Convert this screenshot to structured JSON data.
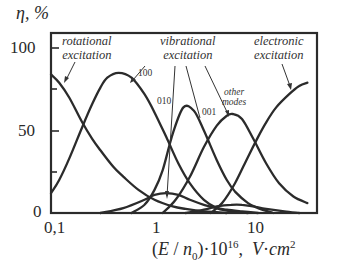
{
  "chart_data": {
    "type": "line",
    "title": "",
    "xlabel": "(E/n0)·10^16, V·cm^2",
    "ylabel": "η, %",
    "xscale": "log",
    "xlim": [
      0.1,
      38
    ],
    "ylim": [
      0,
      100
    ],
    "x_ticks": [
      "0,1",
      "1",
      "10"
    ],
    "y_ticks": [
      "0",
      "50",
      "100"
    ],
    "y_minor_ticks": [
      25,
      75
    ],
    "grid": false,
    "legend": "none (inline annotations)",
    "series": [
      {
        "name": "rotational excitation",
        "x": [
          0.1,
          0.12,
          0.15,
          0.2,
          0.25,
          0.3,
          0.4,
          0.5,
          0.7,
          1.0,
          1.5,
          2.0,
          3.0,
          4.0,
          5.0
        ],
        "values": [
          84,
          79,
          70,
          55,
          45,
          38,
          28,
          22,
          14,
          8,
          4,
          2.5,
          1,
          0.5,
          0
        ]
      },
      {
        "name": "vibrational 100",
        "x": [
          0.1,
          0.12,
          0.15,
          0.2,
          0.25,
          0.3,
          0.35,
          0.45,
          0.6,
          0.8,
          1.0,
          1.3,
          1.7,
          2.2,
          3.0,
          4.0,
          5.0,
          6.0,
          8.0
        ],
        "values": [
          12,
          20,
          33,
          52,
          66,
          76,
          82,
          85,
          82,
          72,
          61,
          46,
          30,
          18,
          8,
          3,
          1.5,
          0.8,
          0
        ]
      },
      {
        "name": "vibrational 010",
        "x": [
          0.6,
          0.8,
          1.0,
          1.2,
          1.5,
          1.9,
          2.4,
          3.0,
          4.0,
          5.0,
          6.0,
          8.0,
          10.0,
          14.0
        ],
        "values": [
          0,
          5,
          14,
          26,
          48,
          64,
          62,
          50,
          32,
          20,
          13,
          6,
          3,
          0
        ]
      },
      {
        "name": "vibrational 001",
        "x": [
          0.3,
          0.5,
          0.8,
          1.0,
          1.3,
          1.7,
          2.2,
          3.0,
          4.0,
          5.0,
          7.0,
          10.0
        ],
        "values": [
          0,
          3,
          8,
          11,
          12,
          11,
          8,
          5,
          3,
          2,
          1,
          0
        ]
      },
      {
        "name": "other modes",
        "x": [
          1.2,
          1.6,
          2.2,
          3.0,
          4.0,
          5.0,
          5.7,
          7.0,
          9.0,
          12.0,
          16.0,
          22.0,
          30.0
        ],
        "values": [
          0,
          8,
          22,
          40,
          53,
          59,
          60,
          57,
          45,
          30,
          18,
          10,
          6
        ]
      },
      {
        "name": "other modes (small)",
        "x": [
          2.0,
          3.0,
          4.0,
          5.5,
          7.0,
          9.0,
          12.0,
          18.0,
          25.0
        ],
        "values": [
          0,
          2,
          4,
          5,
          5,
          4,
          2.5,
          1,
          0
        ]
      },
      {
        "name": "electronic excitation",
        "x": [
          3.5,
          4.5,
          6.0,
          8.0,
          10.0,
          12.0,
          15.0,
          20.0,
          25.0,
          30.0
        ],
        "values": [
          0,
          6,
          18,
          34,
          46,
          55,
          64,
          72,
          77,
          79
        ]
      }
    ],
    "annotations": [
      {
        "text": "rotational excitation",
        "points_to": "rotational excitation curve"
      },
      {
        "text": "vibrational excitation",
        "points_to": [
          "100",
          "010",
          "001",
          "other modes"
        ]
      },
      {
        "text": "100",
        "points_to": "vibrational 100"
      },
      {
        "text": "010",
        "points_to": "vibrational 010 / small peak"
      },
      {
        "text": "001",
        "points_to": "vibrational 001"
      },
      {
        "text": "other modes",
        "points_to": "other modes"
      },
      {
        "text": "electronic excitation",
        "points_to": "electronic excitation"
      }
    ]
  },
  "labels": {
    "ylabel": "η, %",
    "y100": "100",
    "y50": "50",
    "y0": "0",
    "x01": "0,1",
    "x1": "1",
    "x10": "10",
    "rot1": "rotational",
    "rot2": "excitation",
    "vib1": "vibrational",
    "vib2": "excitation",
    "el1": "electronic",
    "el2": "excitation",
    "m100": "100",
    "m010": "010",
    "m001": "001",
    "other1": "other",
    "other2": "modes"
  },
  "colors": {
    "line": "#2b2b2b",
    "frame": "#2b2b2b",
    "background": "#ffffff"
  }
}
